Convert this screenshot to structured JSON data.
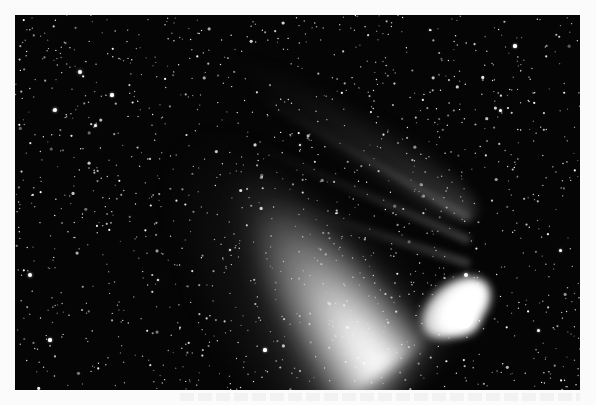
{
  "image": {
    "subject": "comet",
    "description": "Bright comet with a broad white dust tail fanning toward the upper left and a fainter, narrow bluish-grey ion tail streaming to the left, set against a dense star field",
    "style": "black-and-white astrophotograph",
    "frame": {
      "left": 15,
      "top": 15,
      "width": 565,
      "height": 375
    },
    "background_color": "#050505",
    "page_color": "#fbfbfb",
    "nucleus_position": [
      465,
      325
    ],
    "tails": [
      {
        "name": "dust-tail",
        "direction": "upper-left",
        "brightness": "high"
      },
      {
        "name": "ion-tail",
        "direction": "left",
        "brightness": "low"
      }
    ]
  },
  "stars": {
    "seed": 1997,
    "count": 1400,
    "color": "#ffffff"
  },
  "bright_stars": [
    [
      80,
      72,
      2.2
    ],
    [
      55,
      110,
      2.0
    ],
    [
      30,
      275,
      2.0
    ],
    [
      112,
      95,
      1.6
    ],
    [
      466,
      275,
      2.4
    ],
    [
      515,
      46,
      1.6
    ],
    [
      300,
      145,
      1.4
    ],
    [
      265,
      350,
      1.6
    ],
    [
      158,
      280,
      1.4
    ],
    [
      560,
      250,
      1.5
    ],
    [
      95,
      125,
      1.5
    ],
    [
      430,
      30,
      1.4
    ],
    [
      500,
      110,
      1.5
    ],
    [
      50,
      340,
      1.6
    ],
    [
      230,
      250,
      1.3
    ],
    [
      538,
      330,
      1.5
    ]
  ],
  "ion_streamers": [
    {
      "left": 200,
      "top": 200,
      "width": 255,
      "angle": 30
    },
    {
      "left": 215,
      "top": 222,
      "width": 240,
      "angle": 24
    },
    {
      "left": 245,
      "top": 245,
      "width": 210,
      "angle": 18
    }
  ],
  "caption_bleed": {
    "visible": true,
    "legible": false
  }
}
